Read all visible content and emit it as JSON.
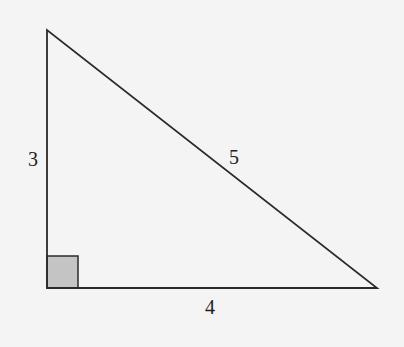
{
  "diagram": {
    "type": "right-triangle",
    "labels": {
      "vertical_leg": "3",
      "horizontal_leg": "4",
      "hypotenuse": "5"
    },
    "colors": {
      "line": "#2a2a2a",
      "right_angle_fill": "#c4c4c4",
      "background": "#f4f4f4"
    }
  }
}
